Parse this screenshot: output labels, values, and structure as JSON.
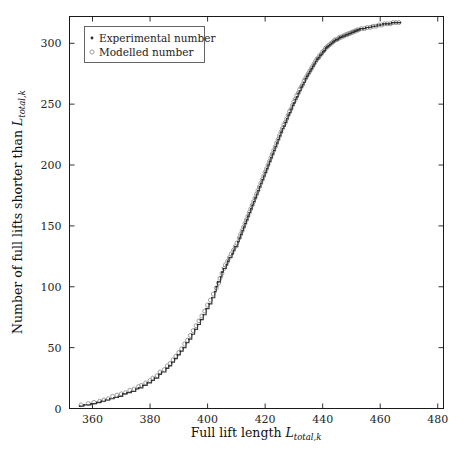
{
  "figure": {
    "background_color": "#ffffff",
    "frame_color": "#1a1a1a",
    "width": 473,
    "height": 454
  },
  "legend": {
    "position": "top-left-inside",
    "entries": [
      {
        "label": "Experimental number",
        "marker": "filled-dot",
        "color": "#2b2b2b"
      },
      {
        "label": "Modelled number",
        "marker": "open-circle",
        "color": "#8c8c8c"
      }
    ]
  },
  "axes": {
    "x": {
      "label_plain": "Full lift length",
      "label_symbol": "L",
      "label_subscript": "total,k",
      "ticks": [
        "360",
        "380",
        "400",
        "420",
        "440",
        "460",
        "480"
      ],
      "range": [
        352,
        482
      ]
    },
    "y": {
      "label_plain": "Number of full lifts shorter than",
      "label_symbol": "L",
      "label_subscript": "total,k",
      "ticks": [
        "0",
        "50",
        "100",
        "150",
        "200",
        "250",
        "300"
      ],
      "range": [
        0,
        322
      ]
    }
  },
  "chart_data": {
    "type": "line",
    "title": "",
    "xlabel": "Full lift length L_total,k",
    "ylabel": "Number of full lifts shorter than L_total,k",
    "xlim": [
      352,
      482
    ],
    "ylim": [
      0,
      322
    ],
    "grid": false,
    "legend_position": "upper left",
    "series": [
      {
        "name": "Experimental number",
        "marker": "filled-dot",
        "color": "#2b2b2b",
        "style": "step",
        "x": [
          355.5,
          357.0,
          359.5,
          361.5,
          363.0,
          364.5,
          366.0,
          367.5,
          369.0,
          370.5,
          372.0,
          373.5,
          375.0,
          376.0,
          377.5,
          379.0,
          380.5,
          381.5,
          383.0,
          384.0,
          385.5,
          386.5,
          387.5,
          388.5,
          389.5,
          390.5,
          391.5,
          392.5,
          393.5,
          394.5,
          395.5,
          396.5,
          397.5,
          398.5,
          399.5,
          400.5,
          401.5,
          402.5,
          403.0,
          403.5,
          404.5,
          405.0,
          405.5,
          406.5,
          407.0,
          407.5,
          408.5,
          409.0,
          409.5,
          410.5,
          411.0,
          411.5,
          412.0,
          412.5,
          413.0,
          413.5,
          414.0,
          414.5,
          415.0,
          415.5,
          416.0,
          416.5,
          417.0,
          417.5,
          418.0,
          418.5,
          419.0,
          419.5,
          420.0,
          420.5,
          421.0,
          421.5,
          422.0,
          422.5,
          423.0,
          423.5,
          424.0,
          424.5,
          425.0,
          425.5,
          426.0,
          426.5,
          427.0,
          427.5,
          428.0,
          428.5,
          429.0,
          429.5,
          430.0,
          430.5,
          431.0,
          431.5,
          432.0,
          432.5,
          433.0,
          433.5,
          434.0,
          434.5,
          435.0,
          435.5,
          436.0,
          436.5,
          437.0,
          437.5,
          438.0,
          438.5,
          439.0,
          439.5,
          440.0,
          440.5,
          441.0,
          441.5,
          442.0,
          442.5,
          443.0,
          443.5,
          444.0,
          444.5,
          445.0,
          445.5,
          446.0,
          446.5,
          447.0,
          447.5,
          448.0,
          448.5,
          449.0,
          449.5,
          450.0,
          450.5,
          451.0,
          451.5,
          452.0,
          452.5,
          453.0,
          454.0,
          455.0,
          456.0,
          457.0,
          458.0,
          459.0,
          460.0,
          461.0,
          462.0,
          463.0,
          464.0,
          465.0,
          466.0,
          467.0
        ],
        "y": [
          2,
          3,
          4,
          5,
          6,
          7,
          8,
          9,
          10,
          12,
          13,
          14,
          16,
          17,
          19,
          21,
          23,
          25,
          28,
          30,
          33,
          35,
          38,
          41,
          44,
          47,
          50,
          54,
          57,
          61,
          65,
          69,
          73,
          77,
          82,
          86,
          91,
          96,
          100,
          104,
          108,
          112,
          115,
          118,
          121,
          124,
          127,
          130,
          133,
          137,
          140,
          143,
          146,
          149,
          152,
          155,
          158,
          161,
          164,
          167,
          170,
          173,
          176,
          179,
          182,
          185,
          188,
          191,
          194,
          197,
          200,
          203,
          206,
          209,
          212,
          215,
          218,
          221,
          224,
          227,
          230,
          232,
          235,
          238,
          241,
          243,
          246,
          249,
          251,
          254,
          256,
          259,
          261,
          264,
          266,
          268,
          271,
          273,
          275,
          277,
          279,
          281,
          283,
          285,
          287,
          288,
          290,
          291,
          293,
          294,
          296,
          297,
          298,
          299,
          300,
          301,
          302,
          303,
          303,
          304,
          305,
          305,
          306,
          306,
          307,
          307,
          308,
          308,
          309,
          309,
          310,
          310,
          311,
          311,
          312,
          312,
          313,
          313,
          314,
          314,
          315,
          315,
          316,
          316,
          316,
          317,
          317,
          317,
          317
        ]
      },
      {
        "name": "Modelled number",
        "marker": "open-circle",
        "color": "#8c8c8c",
        "style": "markers",
        "x": [
          356.0,
          358.5,
          360.5,
          362.5,
          364.0,
          365.5,
          367.0,
          368.5,
          370.0,
          371.5,
          373.0,
          374.5,
          376.0,
          377.0,
          378.5,
          380.0,
          381.0,
          382.5,
          383.5,
          385.0,
          386.0,
          387.0,
          388.0,
          389.0,
          390.0,
          391.0,
          392.0,
          393.0,
          394.0,
          395.0,
          396.0,
          397.0,
          398.0,
          399.0,
          400.0,
          401.0,
          402.0,
          403.0,
          403.8,
          404.3,
          405.0,
          405.7,
          406.2,
          407.0,
          407.6,
          408.2,
          409.0,
          409.6,
          410.2,
          411.0,
          411.5,
          412.0,
          412.5,
          413.0,
          413.5,
          414.0,
          414.5,
          415.0,
          415.5,
          416.0,
          416.5,
          417.0,
          417.5,
          418.0,
          418.5,
          419.0,
          419.5,
          420.0,
          420.5,
          421.0,
          421.5,
          422.0,
          422.5,
          423.0,
          423.5,
          424.0,
          424.5,
          425.0,
          425.5,
          426.0,
          426.5,
          427.0,
          427.5,
          428.0,
          428.5,
          429.0,
          429.5,
          430.0,
          430.5,
          431.0,
          431.5,
          432.0,
          432.5,
          433.0,
          433.5,
          434.0,
          434.5,
          435.0,
          435.5,
          436.0,
          436.5,
          437.0,
          437.5,
          438.0,
          438.5,
          439.0,
          439.5,
          440.0,
          440.5,
          441.0,
          441.5,
          442.0,
          442.5,
          443.0,
          443.5,
          444.0,
          444.5,
          445.0,
          445.5,
          446.0,
          446.5,
          447.0,
          447.5,
          448.0,
          448.5,
          449.0,
          449.5,
          450.0,
          450.5,
          451.0,
          451.5,
          452.0,
          452.5,
          453.5,
          454.5,
          455.5,
          456.5,
          457.5,
          458.5,
          459.5,
          460.5,
          461.5,
          462.5,
          463.5,
          464.5,
          465.5,
          466.5
        ],
        "y": [
          3,
          4,
          5,
          6,
          7,
          8,
          10,
          11,
          12,
          13,
          15,
          16,
          18,
          19,
          21,
          23,
          25,
          27,
          30,
          32,
          35,
          37,
          40,
          43,
          46,
          49,
          53,
          56,
          60,
          64,
          68,
          72,
          76,
          80,
          85,
          89,
          94,
          99,
          103,
          107,
          111,
          115,
          118,
          121,
          124,
          127,
          130,
          133,
          136,
          140,
          143,
          146,
          149,
          152,
          155,
          158,
          161,
          164,
          167,
          170,
          173,
          176,
          179,
          182,
          185,
          188,
          191,
          194,
          197,
          200,
          203,
          206,
          209,
          212,
          215,
          218,
          221,
          224,
          227,
          230,
          233,
          235,
          238,
          241,
          244,
          246,
          249,
          252,
          254,
          257,
          259,
          262,
          264,
          266,
          269,
          271,
          273,
          275,
          277,
          279,
          281,
          283,
          285,
          287,
          288,
          290,
          291,
          293,
          294,
          296,
          297,
          298,
          299,
          300,
          301,
          302,
          303,
          303,
          304,
          305,
          305,
          306,
          306,
          307,
          307,
          308,
          308,
          309,
          309,
          310,
          310,
          311,
          311,
          312,
          312,
          313,
          313,
          314,
          314,
          315,
          315,
          316,
          316,
          316,
          317,
          317,
          317
        ]
      }
    ]
  }
}
